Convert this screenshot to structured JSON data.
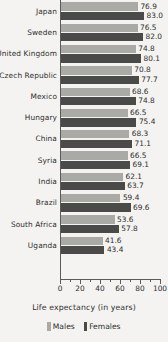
{
  "chart_data": {
    "type": "bar",
    "orientation": "horizontal",
    "title": "",
    "xlabel": "Life expectancy (in years)",
    "ylabel": "",
    "xlim": [
      0,
      100
    ],
    "xticks": [
      0,
      20,
      40,
      60,
      80,
      100
    ],
    "xtick_labels": [
      "0",
      "20",
      "40",
      "60",
      "80",
      "100"
    ],
    "minor_tick_step": 10,
    "grid": false,
    "legend_position": "bottom",
    "categories": [
      "Japan",
      "Sweden",
      "United Kingdom",
      "Czech Republic",
      "Mexico",
      "Hungary",
      "China",
      "Syria",
      "India",
      "Brazil",
      "South Africa",
      "Uganda"
    ],
    "series": [
      {
        "name": "Males",
        "color": "#a9a9a6",
        "values": [
          76.9,
          76.5,
          74.8,
          70.8,
          68.6,
          66.5,
          68.3,
          66.5,
          62.1,
          59.4,
          53.6,
          41.6
        ],
        "value_labels": [
          "76.9",
          "76.5",
          "74.8",
          "70.8",
          "68.6",
          "66.5",
          "68.3",
          "66.5",
          "62.1",
          "59.4",
          "53.6",
          "41.6"
        ]
      },
      {
        "name": "Females",
        "color": "#4a4a48",
        "values": [
          83.0,
          82.0,
          80.1,
          77.7,
          74.8,
          75.4,
          71.1,
          69.1,
          63.7,
          69.6,
          57.8,
          43.4
        ],
        "value_labels": [
          "83.0",
          "82.0",
          "80.1",
          "77.7",
          "74.8",
          "75.4",
          "71.1",
          "69.1",
          "63.7",
          "69.6",
          "57.8",
          "43.4"
        ]
      }
    ]
  },
  "legend": {
    "males_label": "Males",
    "females_label": "Females"
  },
  "axis": {
    "title": "Life expectancy (in years)"
  }
}
